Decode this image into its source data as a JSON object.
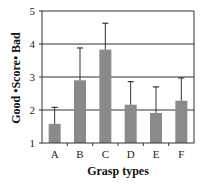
{
  "chart_data": {
    "type": "bar",
    "title": "",
    "xlabel": "Grasp types",
    "ylabel": "Good •Score• Bad",
    "categories": [
      "A",
      "B",
      "C",
      "D",
      "E",
      "F"
    ],
    "values": [
      1.58,
      2.9,
      3.83,
      2.16,
      1.91,
      2.28
    ],
    "error_upper": [
      2.08,
      3.88,
      4.63,
      2.86,
      2.7,
      2.97
    ],
    "ylim": [
      1,
      5
    ],
    "yticks": [
      1,
      2,
      3,
      4,
      5
    ],
    "grid": true,
    "legend": null,
    "bar_color": "#8a8a8a"
  },
  "labels": {
    "xlabel": "Grasp types",
    "ylabel": "Good •Score• Bad",
    "yticks": [
      "1",
      "2",
      "3",
      "4",
      "5"
    ],
    "categories": [
      "A",
      "B",
      "C",
      "D",
      "E",
      "F"
    ]
  }
}
